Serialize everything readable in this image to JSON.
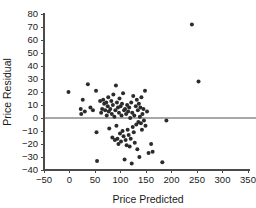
{
  "chart_data": {
    "type": "scatter",
    "title": "",
    "xlabel": "Price Predicted",
    "ylabel": "Price Residual",
    "xlim": [
      -50,
      350
    ],
    "ylim": [
      -40,
      80
    ],
    "xticks": [
      -50,
      0,
      50,
      100,
      150,
      200,
      250,
      300,
      350
    ],
    "yticks": [
      -40,
      -30,
      -20,
      -10,
      0,
      10,
      20,
      30,
      40,
      50,
      60,
      70,
      80
    ],
    "xtick_labels": [
      "−50",
      "0",
      "50",
      "100",
      "150",
      "200",
      "250",
      "300",
      "350"
    ],
    "ytick_labels": [
      "−40",
      "−30",
      "−20",
      "−10",
      "0",
      "10",
      "20",
      "30",
      "40",
      "50",
      "60",
      "70",
      "80"
    ],
    "grid": false,
    "legend": null,
    "reference_line": {
      "orientation": "horizontal",
      "y": 0,
      "color": "#a8a8a8"
    },
    "marker": {
      "shape": "circle",
      "color": "#2b2b2b",
      "size": 2.0
    },
    "series": [
      {
        "name": "residuals",
        "points": [
          [
            -2,
            20
          ],
          [
            22,
            7
          ],
          [
            23,
            3
          ],
          [
            26,
            14
          ],
          [
            30,
            5
          ],
          [
            36,
            26
          ],
          [
            41,
            8
          ],
          [
            46,
            6
          ],
          [
            52,
            21
          ],
          [
            53,
            -11
          ],
          [
            54,
            -33
          ],
          [
            60,
            13
          ],
          [
            62,
            4
          ],
          [
            64,
            7
          ],
          [
            66,
            14
          ],
          [
            68,
            11
          ],
          [
            70,
            6
          ],
          [
            72,
            12
          ],
          [
            73,
            2
          ],
          [
            75,
            9
          ],
          [
            76,
            16
          ],
          [
            77,
            5
          ],
          [
            78,
            -8
          ],
          [
            80,
            7
          ],
          [
            82,
            13
          ],
          [
            83,
            3
          ],
          [
            84,
            -15
          ],
          [
            85,
            10
          ],
          [
            86,
            18
          ],
          [
            88,
            1
          ],
          [
            89,
            -17
          ],
          [
            90,
            6
          ],
          [
            91,
            25
          ],
          [
            92,
            -6
          ],
          [
            93,
            12
          ],
          [
            94,
            -16
          ],
          [
            95,
            8
          ],
          [
            96,
            -20
          ],
          [
            97,
            4
          ],
          [
            98,
            15
          ],
          [
            99,
            -12
          ],
          [
            100,
            9
          ],
          [
            101,
            -18
          ],
          [
            102,
            2
          ],
          [
            103,
            11
          ],
          [
            104,
            -10
          ],
          [
            105,
            19
          ],
          [
            106,
            -14
          ],
          [
            107,
            6
          ],
          [
            108,
            -32
          ],
          [
            109,
            7
          ],
          [
            110,
            -17
          ],
          [
            111,
            3
          ],
          [
            112,
            -21
          ],
          [
            113,
            10
          ],
          [
            114,
            -9
          ],
          [
            115,
            5
          ],
          [
            116,
            -13
          ],
          [
            117,
            8
          ],
          [
            118,
            -22
          ],
          [
            119,
            0
          ],
          [
            120,
            -16
          ],
          [
            121,
            12
          ],
          [
            122,
            -35
          ],
          [
            123,
            4
          ],
          [
            124,
            -7
          ],
          [
            125,
            17
          ],
          [
            126,
            -11
          ],
          [
            127,
            2
          ],
          [
            128,
            -19
          ],
          [
            130,
            9
          ],
          [
            131,
            -5
          ],
          [
            132,
            14
          ],
          [
            133,
            -24
          ],
          [
            134,
            6
          ],
          [
            135,
            -3
          ],
          [
            136,
            11
          ],
          [
            137,
            -30
          ],
          [
            138,
            1
          ],
          [
            139,
            8
          ],
          [
            140,
            -4
          ],
          [
            141,
            16
          ],
          [
            142,
            -9
          ],
          [
            143,
            3
          ],
          [
            145,
            7
          ],
          [
            146,
            -2
          ],
          [
            148,
            21
          ],
          [
            149,
            -6
          ],
          [
            152,
            5
          ],
          [
            155,
            -27
          ],
          [
            160,
            -20
          ],
          [
            163,
            -26
          ],
          [
            182,
            -34
          ],
          [
            190,
            -2
          ],
          [
            240,
            72
          ],
          [
            253,
            28
          ]
        ]
      }
    ]
  },
  "axes": {
    "x_title": "Price Predicted",
    "y_title": "Price Residual"
  }
}
